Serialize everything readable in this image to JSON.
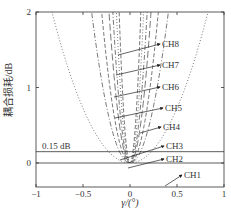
{
  "chart_data": {
    "type": "line",
    "title": "",
    "xlabel": "γ/(°)",
    "ylabel": "耦合损耗/dB",
    "xlim": [
      -1,
      1
    ],
    "ylim": [
      0,
      2
    ],
    "xticks": [
      "-1",
      "-0.5",
      "0",
      "0.5",
      "1"
    ],
    "yticks": [
      "0",
      "1",
      "2"
    ],
    "grid": false,
    "threshold": {
      "value": 0.15,
      "label": "0.15 dB"
    },
    "series": [
      {
        "name": "CH1",
        "curvature": 0.02,
        "style": "solid"
      },
      {
        "name": "CH2",
        "curvature": 2.9,
        "style": "dotted"
      },
      {
        "name": "CH3",
        "curvature": 12,
        "style": "dashdot"
      },
      {
        "name": "CH4",
        "curvature": 22,
        "style": "dashed"
      },
      {
        "name": "CH5",
        "curvature": 40,
        "style": "longdash"
      },
      {
        "name": "CH6",
        "curvature": 60,
        "style": "dashdot"
      },
      {
        "name": "CH7",
        "curvature": 95,
        "style": "dotted"
      },
      {
        "name": "CH8",
        "curvature": 150,
        "style": "dashed"
      }
    ],
    "annotations": [
      "CH8",
      "CH7",
      "CH6",
      "CH5",
      "CH4",
      "CH3",
      "CH2",
      "CH1"
    ]
  }
}
